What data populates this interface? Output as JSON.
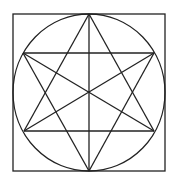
{
  "diagram": {
    "stroke_color": "#222222",
    "background_color": "#ffffff",
    "stroke_width": 1.3,
    "square": {
      "x": 13,
      "y": 14,
      "width": 152,
      "height": 157
    },
    "circle": {
      "cx": 89,
      "cy": 92.5,
      "rx": 76,
      "ry": 78.5
    },
    "vertices": {
      "top": [
        89,
        14
      ],
      "upper_left": [
        23,
        53
      ],
      "upper_right": [
        154,
        53
      ],
      "lower_left": [
        24,
        131
      ],
      "lower_right": [
        154,
        131
      ],
      "bottom": [
        89,
        171
      ],
      "center": [
        89,
        92
      ]
    },
    "lines": [
      {
        "name": "vertical-axis",
        "x1": 89,
        "y1": 14,
        "x2": 89,
        "y2": 171
      },
      {
        "name": "upper-horizontal",
        "x1": 23,
        "y1": 53,
        "x2": 154,
        "y2": 53
      },
      {
        "name": "lower-horizontal",
        "x1": 24,
        "y1": 131,
        "x2": 154,
        "y2": 131
      },
      {
        "name": "diagonal-ul-lr",
        "x1": 23,
        "y1": 53,
        "x2": 154,
        "y2": 131
      },
      {
        "name": "diagonal-ll-ur",
        "x1": 24,
        "y1": 131,
        "x2": 154,
        "y2": 53
      },
      {
        "name": "up-triangle-left",
        "x1": 89,
        "y1": 14,
        "x2": 24,
        "y2": 131
      },
      {
        "name": "up-triangle-right",
        "x1": 89,
        "y1": 14,
        "x2": 154,
        "y2": 131
      },
      {
        "name": "down-triangle-left",
        "x1": 89,
        "y1": 171,
        "x2": 23,
        "y2": 53
      },
      {
        "name": "down-triangle-right",
        "x1": 89,
        "y1": 171,
        "x2": 154,
        "y2": 53
      }
    ]
  }
}
